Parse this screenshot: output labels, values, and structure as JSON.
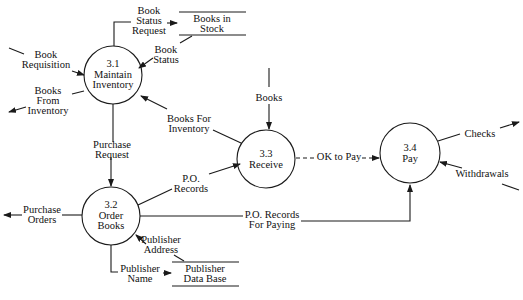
{
  "diagram": {
    "type": "data-flow-diagram",
    "colors": {
      "line": "#1a1a1a",
      "background": "#ffffff",
      "text": "#111111"
    },
    "processes": [
      {
        "id": "3.1",
        "number": "3.1",
        "name": "Maintain\nInventory",
        "label": "3.1\nMaintain\nInventory"
      },
      {
        "id": "3.2",
        "number": "3.2",
        "name": "Order\nBooks",
        "label": "3.2\nOrder\nBooks"
      },
      {
        "id": "3.3",
        "number": "3.3",
        "name": "Receive",
        "label": "3.3\nReceive"
      },
      {
        "id": "3.4",
        "number": "3.4",
        "name": "Pay",
        "label": "3.4\nPay"
      }
    ],
    "data_stores": [
      {
        "id": "books-in-stock",
        "label": "Books in\nStock"
      },
      {
        "id": "publisher-database",
        "label": "Publisher\nData Base"
      }
    ],
    "flows": [
      {
        "label": "Book\nStatus\nRequest",
        "from": "3.1",
        "to": "Books in Stock"
      },
      {
        "label": "Book\nStatus",
        "from": "Books in Stock",
        "to": "3.1"
      },
      {
        "label": "Book\nRequisition",
        "from": "external",
        "to": "3.1"
      },
      {
        "label": "Books\nFrom\nInventory",
        "from": "3.1",
        "to": "external"
      },
      {
        "label": "Books For\nInventory",
        "from": "3.3",
        "to": "3.1"
      },
      {
        "label": "Purchase\nRequest",
        "from": "3.1",
        "to": "3.2"
      },
      {
        "label": "Books",
        "from": "external",
        "to": "3.3"
      },
      {
        "label": "OK to Pay",
        "from": "3.3",
        "to": "3.4",
        "style": "dashed"
      },
      {
        "label": "P.O.\nRecords",
        "from": "3.2",
        "to": "3.3"
      },
      {
        "label": "Purchase\nOrders",
        "from": "3.2",
        "to": "external"
      },
      {
        "label": "P.O. Records\nFor Paying",
        "from": "3.2",
        "to": "3.4"
      },
      {
        "label": "Publisher\nAddress",
        "from": "Publisher Data Base",
        "to": "3.2"
      },
      {
        "label": "Publisher\nName",
        "from": "3.2",
        "to": "Publisher Data Base"
      },
      {
        "label": "Checks",
        "from": "3.4",
        "to": "external"
      },
      {
        "label": "Withdrawals",
        "from": "external",
        "to": "3.4"
      }
    ]
  }
}
